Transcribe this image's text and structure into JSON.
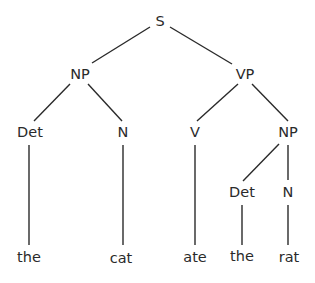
{
  "diagram": {
    "type": "syntax-tree",
    "colors": {
      "line": "#2a2a2a",
      "text": "#2a2a2a",
      "background": "#ffffff"
    },
    "nodes": [
      {
        "id": "S",
        "label": "S",
        "x": 160,
        "y": 22
      },
      {
        "id": "NP1",
        "label": "NP",
        "x": 80,
        "y": 75
      },
      {
        "id": "VP",
        "label": "VP",
        "x": 245,
        "y": 75
      },
      {
        "id": "Det1",
        "label": "Det",
        "x": 30,
        "y": 133
      },
      {
        "id": "N1",
        "label": "N",
        "x": 123,
        "y": 133
      },
      {
        "id": "V",
        "label": "V",
        "x": 195,
        "y": 133
      },
      {
        "id": "NP2",
        "label": "NP",
        "x": 288,
        "y": 133
      },
      {
        "id": "Det2",
        "label": "Det",
        "x": 242,
        "y": 193
      },
      {
        "id": "N2",
        "label": "N",
        "x": 288,
        "y": 193
      },
      {
        "id": "w1",
        "label": "the",
        "x": 29,
        "y": 258
      },
      {
        "id": "w2",
        "label": "cat",
        "x": 121,
        "y": 259
      },
      {
        "id": "w3",
        "label": "ate",
        "x": 195,
        "y": 258
      },
      {
        "id": "w4",
        "label": "the",
        "x": 242,
        "y": 257
      },
      {
        "id": "w5",
        "label": "rat",
        "x": 289,
        "y": 258
      }
    ],
    "edges": [
      {
        "from": "S",
        "to": "NP1",
        "x1": 150,
        "y1": 27,
        "x2": 92,
        "y2": 63
      },
      {
        "from": "S",
        "to": "VP",
        "x1": 170,
        "y1": 27,
        "x2": 232,
        "y2": 64
      },
      {
        "from": "NP1",
        "to": "Det1",
        "x1": 70,
        "y1": 84,
        "x2": 34,
        "y2": 121
      },
      {
        "from": "NP1",
        "to": "N1",
        "x1": 88,
        "y1": 84,
        "x2": 122,
        "y2": 121
      },
      {
        "from": "VP",
        "to": "V",
        "x1": 238,
        "y1": 84,
        "x2": 197,
        "y2": 121
      },
      {
        "from": "VP",
        "to": "NP2",
        "x1": 252,
        "y1": 84,
        "x2": 288,
        "y2": 121
      },
      {
        "from": "Det1",
        "to": "w1",
        "x1": 29,
        "y1": 145,
        "x2": 29,
        "y2": 245
      },
      {
        "from": "N1",
        "to": "w2",
        "x1": 123,
        "y1": 145,
        "x2": 123,
        "y2": 245
      },
      {
        "from": "V",
        "to": "w3",
        "x1": 195,
        "y1": 145,
        "x2": 195,
        "y2": 245
      },
      {
        "from": "NP2",
        "to": "Det2",
        "x1": 279,
        "y1": 144,
        "x2": 243,
        "y2": 181
      },
      {
        "from": "NP2",
        "to": "N2",
        "x1": 288,
        "y1": 145,
        "x2": 288,
        "y2": 180
      },
      {
        "from": "Det2",
        "to": "w4",
        "x1": 242,
        "y1": 205,
        "x2": 242,
        "y2": 245
      },
      {
        "from": "N2",
        "to": "w5",
        "x1": 288,
        "y1": 205,
        "x2": 288,
        "y2": 245
      }
    ]
  }
}
